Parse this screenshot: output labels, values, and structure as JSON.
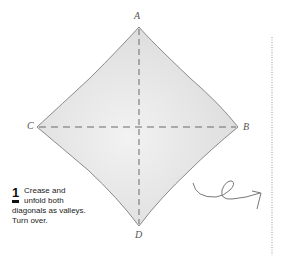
{
  "diagram": {
    "vertices": {
      "top": {
        "label": "A"
      },
      "right": {
        "label": "B"
      },
      "left": {
        "label": "C"
      },
      "bottom": {
        "label": "D"
      }
    },
    "fill_color": "#e6e6e6",
    "edge_color": "#8a8a8a",
    "crease_color": "#6a6a6a",
    "crease_style": "valley (dashed)",
    "fold_line_style": "dotted"
  },
  "step": {
    "number": "1",
    "line1": "Crease and",
    "line2": "unfold both",
    "line3": "diagonals as valleys.",
    "line4": "Turn over."
  },
  "symbols": {
    "turn_over": "turn-over-arrow"
  }
}
